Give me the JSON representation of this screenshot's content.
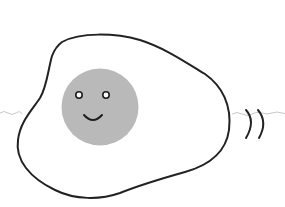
{
  "illustration": {
    "subject": "fried egg with smiling face",
    "colors": {
      "background": "#ffffff",
      "egg_white": "#ffffff",
      "outline": "#222222",
      "yolk": "#b9b9b9",
      "face": "#1e1e1e",
      "eye_fill": "#ffffff",
      "motion_lines": "#222222",
      "wavy_line": "#c8c8c8"
    },
    "elements": [
      "egg-white",
      "yolk",
      "left-eye",
      "right-eye",
      "smile",
      "motion-lines",
      "wavy-line"
    ]
  }
}
